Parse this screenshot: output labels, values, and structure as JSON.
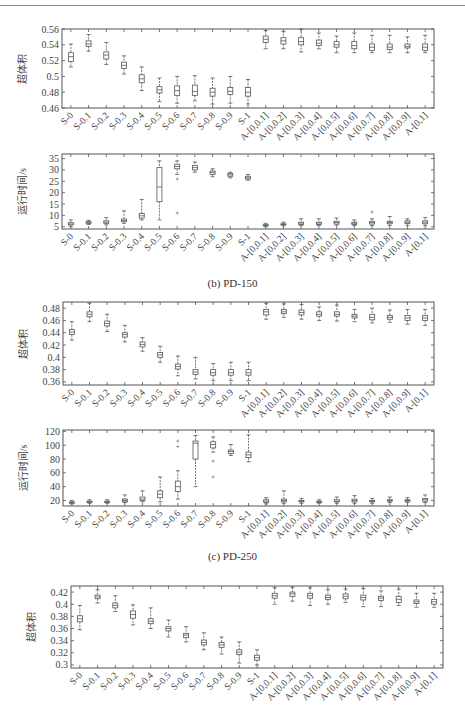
{
  "header": {
    "page_number": "...",
    "running_title": "..."
  },
  "captions": {
    "b": "(b) PD-150",
    "c": "(c) PD-250"
  },
  "categories": [
    "S-0",
    "S-0.1",
    "S-0.2",
    "S-0.3",
    "S-0.4",
    "S-0.5",
    "S-0.6",
    "S-0.7",
    "S-0.8",
    "S-0.9",
    "S-1",
    "A-[0,0.1]",
    "A-[0,0.2]",
    "A-[0,0.3]",
    "A-[0,0.4]",
    "A-[0,0.5]",
    "A-[0,0.6]",
    "A-[0,0.7]",
    "A-[0,0.8]",
    "A-[0,0.9]",
    "A-[0,1]"
  ],
  "chart_data": [
    {
      "id": "pd100-hv",
      "type": "box",
      "title": "",
      "xlabel": "",
      "ylabel": "超体积",
      "ylim": [
        0.46,
        0.56
      ],
      "yticks": [
        0.46,
        0.48,
        0.5,
        0.52,
        0.54,
        0.56
      ],
      "ytick_labels": [
        "0.46",
        "0.48",
        "0.5",
        "0.52",
        "0.54",
        "0.56"
      ],
      "frame": {
        "x": 62,
        "y": 29,
        "w": 372,
        "h": 79
      },
      "categories": [
        "S-0",
        "S-0.1",
        "S-0.2",
        "S-0.3",
        "S-0.4",
        "S-0.5",
        "S-0.6",
        "S-0.7",
        "S-0.8",
        "S-0.9",
        "S-1",
        "A-[0,0.1]",
        "A-[0,0.2]",
        "A-[0,0.3]",
        "A-[0,0.4]",
        "A-[0,0.5]",
        "A-[0,0.6]",
        "A-[0,0.7]",
        "A-[0,0.8]",
        "A-[0,0.9]",
        "A-[0,1]"
      ],
      "median": [
        0.525,
        0.541,
        0.527,
        0.514,
        0.497,
        0.483,
        0.482,
        0.481,
        0.48,
        0.481,
        0.48,
        0.547,
        0.545,
        0.544,
        0.542,
        0.54,
        0.539,
        0.537,
        0.537,
        0.538,
        0.537
      ],
      "q1": [
        0.519,
        0.538,
        0.522,
        0.51,
        0.492,
        0.479,
        0.476,
        0.476,
        0.475,
        0.477,
        0.475,
        0.543,
        0.541,
        0.54,
        0.539,
        0.537,
        0.535,
        0.533,
        0.534,
        0.536,
        0.533
      ],
      "q3": [
        0.53,
        0.545,
        0.531,
        0.518,
        0.502,
        0.487,
        0.488,
        0.489,
        0.485,
        0.486,
        0.486,
        0.551,
        0.549,
        0.549,
        0.546,
        0.544,
        0.544,
        0.541,
        0.541,
        0.541,
        0.541
      ],
      "whisker_low": [
        0.512,
        0.532,
        0.515,
        0.503,
        0.482,
        0.468,
        0.466,
        0.469,
        0.465,
        0.466,
        0.465,
        0.535,
        0.535,
        0.531,
        0.535,
        0.53,
        0.53,
        0.53,
        0.53,
        0.53,
        0.53
      ],
      "whisker_high": [
        0.541,
        0.553,
        0.543,
        0.526,
        0.512,
        0.498,
        0.5,
        0.501,
        0.498,
        0.5,
        0.496,
        0.558,
        0.557,
        0.56,
        0.555,
        0.551,
        0.555,
        0.552,
        0.552,
        0.55,
        0.552
      ]
    },
    {
      "id": "pd100-time",
      "type": "box",
      "title": "",
      "xlabel": "",
      "ylabel": "运行时间/s",
      "ylim": [
        4,
        37
      ],
      "yticks": [
        5,
        10,
        15,
        20,
        25,
        30,
        35
      ],
      "ytick_labels": [
        "5",
        "10",
        "15",
        "20",
        "25",
        "30",
        "35"
      ],
      "frame": {
        "x": 62,
        "y": 154,
        "w": 372,
        "h": 75
      },
      "categories": [
        "S-0",
        "S-0.1",
        "S-0.2",
        "S-0.3",
        "S-0.4",
        "S-0.5",
        "S-0.6",
        "S-0.7",
        "S-0.8",
        "S-0.9",
        "S-1",
        "A-[0,0.1]",
        "A-[0,0.2]",
        "A-[0,0.3]",
        "A-[0,0.4]",
        "A-[0,0.5]",
        "A-[0,0.6]",
        "A-[0,0.7]",
        "A-[0,0.8]",
        "A-[0,0.9]",
        "A-[0,1]"
      ],
      "median": [
        6.2,
        6.8,
        7.0,
        7.8,
        9.8,
        22.5,
        31.5,
        31.0,
        28.8,
        27.8,
        26.5,
        5.6,
        6.0,
        6.6,
        6.6,
        6.9,
        6.5,
        6.8,
        6.9,
        7.0,
        7.0
      ],
      "q1": [
        5.8,
        6.5,
        6.5,
        7.2,
        8.8,
        16.0,
        30.5,
        30.0,
        28.0,
        27.2,
        26.0,
        5.4,
        5.8,
        6.0,
        6.0,
        6.2,
        6.0,
        6.2,
        6.3,
        6.4,
        6.3
      ],
      "q3": [
        6.8,
        7.2,
        7.6,
        8.4,
        10.8,
        31.0,
        32.5,
        32.0,
        29.5,
        28.4,
        27.2,
        5.9,
        6.3,
        7.0,
        7.0,
        7.4,
        7.0,
        7.4,
        7.4,
        7.6,
        7.6
      ],
      "whisker_low": [
        5.0,
        6.0,
        5.8,
        6.5,
        8.0,
        8.0,
        28.0,
        29.0,
        27.0,
        26.5,
        25.5,
        5.0,
        5.4,
        5.5,
        5.5,
        5.7,
        5.5,
        5.5,
        5.6,
        5.6,
        5.5
      ],
      "whisker_high": [
        8.0,
        7.8,
        9.0,
        12.0,
        17.0,
        34.0,
        34.0,
        33.5,
        30.5,
        29.0,
        28.0,
        6.5,
        7.0,
        8.5,
        8.5,
        8.8,
        8.0,
        8.5,
        9.5,
        8.5,
        9.0
      ],
      "outliers": [
        [],
        [],
        [],
        [],
        [],
        [],
        [
          11.0,
          26.0
        ],
        [],
        [],
        [],
        [],
        [],
        [],
        [],
        [],
        [],
        [],
        [
          11.5
        ],
        [],
        [],
        []
      ]
    },
    {
      "id": "pd150-hv",
      "type": "box",
      "title": "",
      "xlabel": "",
      "ylabel": "超体积",
      "ylim": [
        0.355,
        0.49
      ],
      "yticks": [
        0.36,
        0.38,
        0.4,
        0.42,
        0.44,
        0.46,
        0.48
      ],
      "ytick_labels": [
        "0.36",
        "0.38",
        "0.4",
        "0.42",
        "0.44",
        "0.46",
        "0.48"
      ],
      "frame": {
        "x": 63,
        "y": 302,
        "w": 371,
        "h": 83
      },
      "categories": [
        "S-0",
        "S-0.1",
        "S-0.2",
        "S-0.3",
        "S-0.4",
        "S-0.5",
        "S-0.6",
        "S-0.7",
        "S-0.8",
        "S-0.9",
        "S-1",
        "A-[0,0.1]",
        "A-[0,0.2]",
        "A-[0,0.3]",
        "A-[0,0.4]",
        "A-[0,0.5]",
        "A-[0,0.6]",
        "A-[0,0.7]",
        "A-[0,0.8]",
        "A-[0,0.9]",
        "A-[0,1]"
      ],
      "median": [
        0.441,
        0.47,
        0.455,
        0.437,
        0.421,
        0.404,
        0.385,
        0.376,
        0.375,
        0.375,
        0.375,
        0.474,
        0.474,
        0.473,
        0.47,
        0.47,
        0.467,
        0.465,
        0.465,
        0.464,
        0.464
      ],
      "q1": [
        0.437,
        0.466,
        0.451,
        0.433,
        0.417,
        0.4,
        0.381,
        0.372,
        0.371,
        0.371,
        0.371,
        0.469,
        0.471,
        0.469,
        0.467,
        0.467,
        0.464,
        0.461,
        0.462,
        0.46,
        0.46
      ],
      "q3": [
        0.445,
        0.474,
        0.459,
        0.44,
        0.425,
        0.408,
        0.389,
        0.38,
        0.38,
        0.38,
        0.38,
        0.478,
        0.478,
        0.477,
        0.474,
        0.474,
        0.47,
        0.47,
        0.468,
        0.468,
        0.468
      ],
      "whisker_low": [
        0.428,
        0.458,
        0.442,
        0.425,
        0.41,
        0.392,
        0.37,
        0.365,
        0.362,
        0.362,
        0.362,
        0.462,
        0.465,
        0.462,
        0.46,
        0.459,
        0.458,
        0.456,
        0.457,
        0.454,
        0.452
      ],
      "whisker_high": [
        0.458,
        0.488,
        0.47,
        0.452,
        0.432,
        0.418,
        0.402,
        0.4,
        0.39,
        0.392,
        0.392,
        0.488,
        0.487,
        0.486,
        0.482,
        0.485,
        0.478,
        0.48,
        0.477,
        0.478,
        0.478
      ]
    },
    {
      "id": "pd150-time",
      "type": "box",
      "title": "",
      "xlabel": "",
      "ylabel": "运行时间/s",
      "ylim": [
        12,
        122
      ],
      "yticks": [
        20,
        40,
        60,
        80,
        100,
        120
      ],
      "ytick_labels": [
        "20",
        "40",
        "60",
        "80",
        "100",
        "120"
      ],
      "frame": {
        "x": 63,
        "y": 430,
        "w": 371,
        "h": 76
      },
      "categories": [
        "S-0",
        "S-0.1",
        "S-0.2",
        "S-0.3",
        "S-0.4",
        "S-0.5",
        "S-0.6",
        "S-0.7",
        "S-0.8",
        "S-0.9",
        "S-1",
        "A-[0,0.1]",
        "A-[0,0.2]",
        "A-[0,0.3]",
        "A-[0,0.4]",
        "A-[0,0.5]",
        "A-[0,0.6]",
        "A-[0,0.7]",
        "A-[0,0.8]",
        "A-[0,0.9]",
        "A-[0,1]"
      ],
      "median": [
        17,
        18,
        18,
        20,
        22,
        29,
        40,
        103,
        101,
        91,
        86,
        19,
        20,
        19,
        18,
        19,
        20,
        19,
        20,
        20,
        21
      ],
      "q1": [
        16,
        17,
        17,
        18,
        20,
        24,
        33,
        80,
        96,
        88,
        82,
        17,
        18,
        18,
        17,
        18,
        18,
        18,
        19,
        19,
        19
      ],
      "q3": [
        18,
        19,
        19,
        22,
        25,
        34,
        48,
        106,
        105,
        93,
        90,
        21,
        22,
        20,
        19,
        21,
        22,
        20,
        21,
        21,
        23
      ],
      "whisker_low": [
        15,
        16,
        16,
        17,
        18,
        18,
        22,
        40,
        90,
        85,
        76,
        15,
        16,
        16,
        16,
        16,
        16,
        16,
        17,
        17,
        17
      ],
      "whisker_high": [
        20,
        21,
        21,
        28,
        34,
        54,
        63,
        114,
        112,
        101,
        115,
        24,
        34,
        23,
        21,
        25,
        27,
        23,
        25,
        24,
        28
      ],
      "outliers": [
        [],
        [],
        [],
        [],
        [],
        [],
        [
          98,
          106
        ],
        [],
        [
          54,
          77
        ],
        [],
        [],
        [],
        [],
        [],
        [],
        [],
        [],
        [],
        [],
        [],
        []
      ]
    },
    {
      "id": "pd250-hv",
      "type": "box",
      "title": "",
      "xlabel": "",
      "ylabel": "超体积",
      "ylim": [
        0.295,
        0.43
      ],
      "yticks": [
        0.3,
        0.32,
        0.34,
        0.36,
        0.38,
        0.4,
        0.42
      ],
      "ytick_labels": [
        "0.3",
        "0.32",
        "0.34",
        "0.36",
        "0.38",
        "0.4",
        "0.42"
      ],
      "frame": {
        "x": 71,
        "y": 586,
        "w": 372,
        "h": 82
      },
      "categories": [
        "S-0",
        "S-0.1",
        "S-0.2",
        "S-0.3",
        "S-0.4",
        "S-0.5",
        "S-0.6",
        "S-0.7",
        "S-0.8",
        "S-0.9",
        "S-1",
        "A-[0,0.1]",
        "A-[0,0.2]",
        "A-[0,0.3]",
        "A-[0,0.4]",
        "A-[0,0.5]",
        "A-[0,0.6]",
        "A-[0,0.7]",
        "A-[0,0.8]",
        "A-[0,0.9]",
        "A-[0,1]"
      ],
      "median": [
        0.376,
        0.412,
        0.398,
        0.383,
        0.372,
        0.36,
        0.349,
        0.337,
        0.333,
        0.321,
        0.312,
        0.414,
        0.417,
        0.414,
        0.411,
        0.413,
        0.411,
        0.41,
        0.408,
        0.404,
        0.404
      ],
      "q1": [
        0.371,
        0.409,
        0.394,
        0.377,
        0.368,
        0.356,
        0.345,
        0.333,
        0.329,
        0.317,
        0.308,
        0.41,
        0.413,
        0.41,
        0.408,
        0.409,
        0.407,
        0.406,
        0.403,
        0.401,
        0.4
      ],
      "q3": [
        0.381,
        0.415,
        0.402,
        0.389,
        0.376,
        0.363,
        0.352,
        0.341,
        0.337,
        0.325,
        0.316,
        0.418,
        0.42,
        0.418,
        0.415,
        0.417,
        0.415,
        0.413,
        0.413,
        0.407,
        0.408
      ],
      "whisker_low": [
        0.358,
        0.402,
        0.388,
        0.366,
        0.36,
        0.346,
        0.338,
        0.325,
        0.318,
        0.303,
        0.3,
        0.4,
        0.405,
        0.398,
        0.4,
        0.403,
        0.396,
        0.396,
        0.398,
        0.395,
        0.395
      ],
      "whisker_high": [
        0.398,
        0.424,
        0.414,
        0.399,
        0.394,
        0.374,
        0.363,
        0.353,
        0.346,
        0.338,
        0.325,
        0.427,
        0.428,
        0.427,
        0.424,
        0.425,
        0.426,
        0.422,
        0.425,
        0.418,
        0.418
      ]
    }
  ]
}
